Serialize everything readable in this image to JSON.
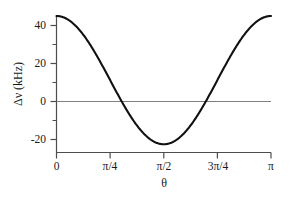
{
  "chart_data": {
    "type": "line",
    "title": "",
    "subtitle": "",
    "xlabel": "θ",
    "ylabel": "Δν (kHz)",
    "xlim": [
      0,
      3.14159265
    ],
    "ylim": [
      -30,
      48
    ],
    "grid": false,
    "legend": null,
    "xtick_labels": [
      "0",
      "π/4",
      "π/2",
      "3π/4",
      "π"
    ],
    "xtick_values": [
      0,
      0.7853982,
      1.5707963,
      2.3561945,
      3.1415927
    ],
    "xminor_tick_values": [
      0.3926991,
      1.1780972,
      1.9634954,
      2.7488936
    ],
    "ytick_labels": [
      "40",
      "20",
      "0",
      "-20"
    ],
    "ytick_values": [
      40,
      20,
      0,
      -20
    ],
    "yminor_tick_values": [
      30,
      10,
      -10
    ],
    "zero_line_value": 0,
    "series": [
      {
        "name": "Δν(θ)",
        "formula": "45 * (3*cos^2(θ) - 1) / 2",
        "max_value": 45,
        "min_value": -22.5,
        "zero_crossings": [
          0.9553166,
          2.186276
        ],
        "x": [
          0.0,
          0.0628319,
          0.1256637,
          0.1884956,
          0.2513274,
          0.3141593,
          0.3769911,
          0.439823,
          0.5026548,
          0.5654867,
          0.6283185,
          0.6911504,
          0.7539822,
          0.8168141,
          0.8796459,
          0.9424778,
          1.0053096,
          1.0681415,
          1.1309734,
          1.1938052,
          1.2566371,
          1.3194689,
          1.3823008,
          1.4451326,
          1.5079645,
          1.5707963,
          1.6336282,
          1.69646,
          1.7592919,
          1.8221237,
          1.8849556,
          1.9477874,
          2.0106193,
          2.0734512,
          2.136283,
          2.1991149,
          2.2619467,
          2.3247786,
          2.3876104,
          2.4504423,
          2.5132741,
          2.576106,
          2.6389378,
          2.7017697,
          2.7646015,
          2.8274334,
          2.8902652,
          2.9530971,
          3.0159289,
          3.0787608,
          3.1415927
        ],
        "y": [
          45.0,
          44.73,
          43.94,
          42.63,
          40.82,
          38.53,
          35.79,
          32.63,
          29.1,
          25.24,
          21.1,
          16.75,
          12.23,
          7.62,
          2.98,
          -1.63,
          -6.16,
          -10.55,
          -14.76,
          -18.72,
          -22.5,
          -22.5,
          -22.5,
          -22.5,
          -22.5,
          -22.5,
          -22.5,
          -22.5,
          -22.5,
          -22.5,
          -22.5,
          -18.72,
          -14.76,
          -10.55,
          -6.16,
          -1.63,
          2.98,
          7.62,
          12.23,
          16.75,
          21.1,
          25.24,
          29.1,
          32.63,
          35.79,
          38.53,
          40.82,
          42.63,
          43.94,
          44.73,
          45.0
        ]
      }
    ]
  },
  "axes": {
    "ylabel": "Δν (kHz)",
    "ylabel_delta": "Δ",
    "ylabel_nu": "ν",
    "ylabel_unit": "(kHz)",
    "xlabel": "θ"
  },
  "ticks": {
    "y": [
      {
        "label": "40",
        "value": 40
      },
      {
        "label": "20",
        "value": 20
      },
      {
        "label": "0",
        "value": 0
      },
      {
        "label": "-20",
        "value": -20
      }
    ],
    "x": [
      {
        "label": "0",
        "value": 0
      },
      {
        "label": "π/4",
        "value": 0.7853982
      },
      {
        "label": "π/2",
        "value": 1.5707963
      },
      {
        "label": "3π/4",
        "value": 2.3561945
      },
      {
        "label": "π",
        "value": 3.1415927
      }
    ]
  },
  "colors": {
    "curve": "#111111",
    "axis": "#4d4d4d",
    "zero_line": "#808080",
    "background": "#ffffff",
    "text": "#1a1a1a"
  }
}
